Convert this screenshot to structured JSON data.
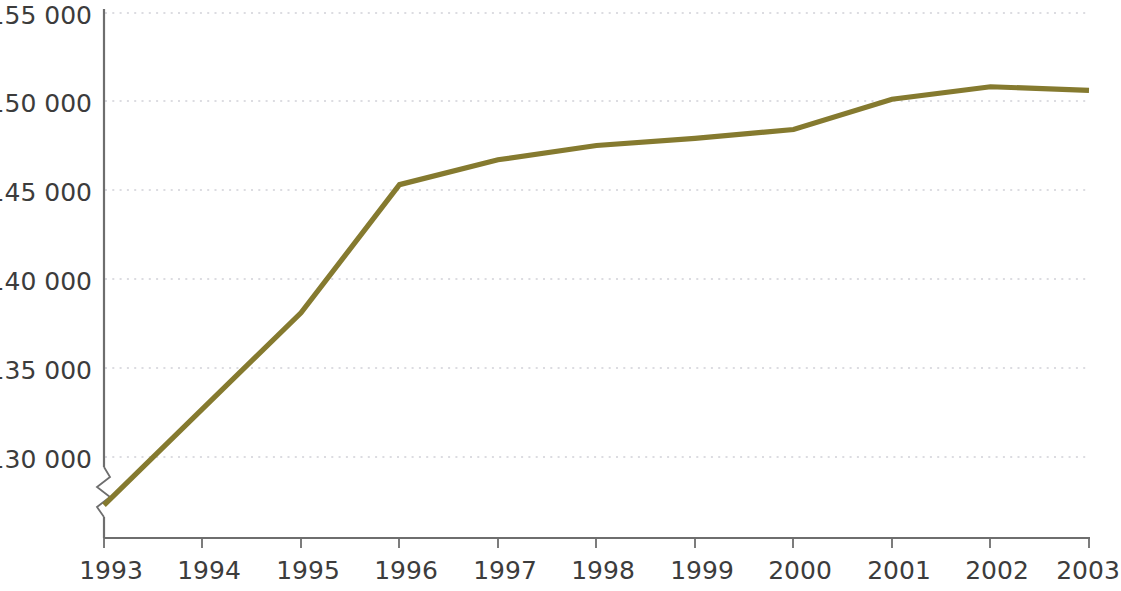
{
  "chart_data": {
    "type": "line",
    "title": "",
    "subtitle": "",
    "xlabel": "",
    "ylabel": "",
    "x": [
      1993,
      1994,
      1995,
      1996,
      1997,
      1998,
      1999,
      2000,
      2001,
      2002,
      2003
    ],
    "categories": [
      "1993",
      "1994",
      "1995",
      "1996",
      "1997",
      "1998",
      "1999",
      "2000",
      "2001",
      "2002",
      "2003"
    ],
    "series": [
      {
        "name": "",
        "color": "#857a2f",
        "values": [
          127300,
          132700,
          138100,
          145300,
          146700,
          147500,
          147900,
          148400,
          150100,
          150800,
          150600
        ]
      }
    ],
    "values": [
      127300,
      132700,
      138100,
      145300,
      146700,
      147500,
      147900,
      148400,
      150100,
      150800,
      150600
    ],
    "ylim": [
      126500,
      155000
    ],
    "xlim": [
      1993,
      2003
    ],
    "y_ticks": [
      130000,
      135000,
      140000,
      145000,
      150000,
      155000
    ],
    "y_tick_labels": [
      "130 000",
      "135 000",
      "140 000",
      "145 000",
      "150 000",
      "155 000"
    ],
    "x_ticks": [
      1993,
      1994,
      1995,
      1996,
      1997,
      1998,
      1999,
      2000,
      2001,
      2002,
      2003
    ],
    "x_tick_labels": [
      "1993",
      "1994",
      "1995",
      "1996",
      "1997",
      "1998",
      "1999",
      "2000",
      "2001",
      "2002",
      "2003"
    ],
    "grid": "horizontal-dotted",
    "legend": "none",
    "axis_break": {
      "axis": "y",
      "present": true,
      "below_value": 129000
    },
    "annotations": []
  },
  "axis": {
    "y_labels": {
      "t130000": "130 000",
      "t135000": "135 000",
      "t140000": "140 000",
      "t145000": "145 000",
      "t150000": "150 000",
      "t155000": "155 000"
    },
    "x_labels": {
      "y1993": "1993",
      "y1994": "1994",
      "y1995": "1995",
      "y1996": "1996",
      "y1997": "1997",
      "y1998": "1998",
      "y1999": "1999",
      "y2000": "2000",
      "y2001": "2001",
      "y2002": "2002",
      "y2003": "2003"
    }
  },
  "colors": {
    "series": "#857a2f",
    "axis": "#6e6e6e",
    "grid": "#b9b9c4",
    "text": "#3c3c3c",
    "background": "#ffffff"
  }
}
